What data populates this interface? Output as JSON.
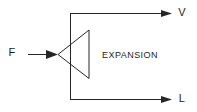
{
  "diagram": {
    "background_color": "#ffffff",
    "line_color": "#262626",
    "text_color": "#1d1d1d",
    "block": {
      "label": "EXPANSION",
      "shape": "triangle-left",
      "apex": {
        "x": 58,
        "y": 54
      },
      "base_x": 89,
      "base_top_y": 30,
      "base_bottom_y": 78,
      "label_position": {
        "x": 130,
        "y": 56
      }
    },
    "bus": {
      "name": "vertical-bus",
      "x": 70,
      "y_top": 13,
      "y_bottom": 99
    },
    "ports": [
      {
        "id": "input-f",
        "label": "F",
        "direction": "input",
        "label_position": {
          "x": 12,
          "y": 53
        },
        "line_start_x": 28,
        "line_end_x": 58,
        "line_y": 54,
        "arrow_tip_x": 58
      },
      {
        "id": "output-v",
        "label": "V",
        "direction": "output",
        "label_position": {
          "x": 182,
          "y": 13
        },
        "line_start_x": 70,
        "line_end_x": 172,
        "line_y": 13,
        "arrow_tip_x": 172
      },
      {
        "id": "output-l",
        "label": "L",
        "direction": "output",
        "label_position": {
          "x": 182,
          "y": 99
        },
        "line_start_x": 70,
        "line_end_x": 172,
        "line_y": 99,
        "arrow_tip_x": 172
      }
    ]
  }
}
